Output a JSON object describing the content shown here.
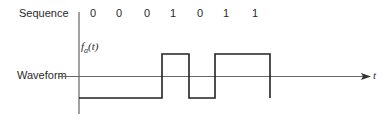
{
  "diagram": {
    "sequence_label": "Sequence",
    "sequence": [
      "0",
      "0",
      "0",
      "1",
      "0",
      "1",
      "1"
    ],
    "waveform_label": "Waveform",
    "y_axis_label_main": "f",
    "y_axis_label_sub": "a",
    "y_axis_label_arg": "(t)",
    "x_axis_label": "t"
  },
  "colors": {
    "line": "#222222",
    "axis": "#555555"
  }
}
